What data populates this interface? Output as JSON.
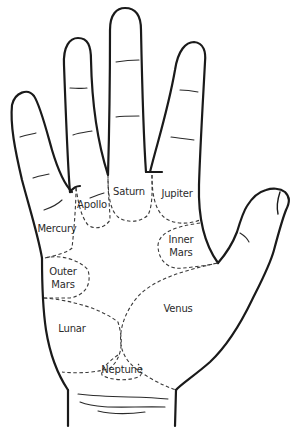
{
  "diagram": {
    "colors": {
      "outline": "#1a1a1a",
      "mount_border": "#3a3a3a",
      "text": "#2b2b2b",
      "background": "#ffffff"
    },
    "mounts": [
      {
        "id": "saturn",
        "label": "Saturn"
      },
      {
        "id": "jupiter",
        "label": "Jupiter"
      },
      {
        "id": "apollo",
        "label": "Apollo"
      },
      {
        "id": "mercury",
        "label": "Mercury"
      },
      {
        "id": "inner-mars",
        "label": "Inner\nMars",
        "line1": "Inner",
        "line2": "Mars"
      },
      {
        "id": "outer-mars",
        "label": "Outer\nMars",
        "line1": "Outer",
        "line2": "Mars"
      },
      {
        "id": "venus",
        "label": "Venus"
      },
      {
        "id": "lunar",
        "label": "Lunar"
      },
      {
        "id": "neptune",
        "label": "Neptune"
      }
    ]
  }
}
